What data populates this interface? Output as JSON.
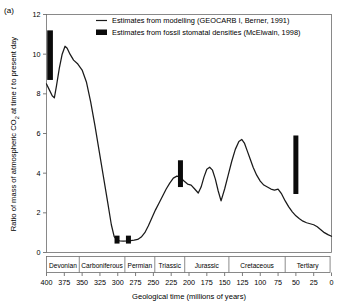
{
  "panel": {
    "label": "(a)"
  },
  "legend": {
    "position": "top-center-inside",
    "entries": [
      {
        "marker": "line",
        "label": "Estimates from modelling (GEOCARB I, Berner, 1991)"
      },
      {
        "marker": "square",
        "label": "Estimates from fossil stomatal densities (McElwain, 1998)"
      }
    ]
  },
  "chart_data": {
    "type": "line",
    "title": "",
    "xlabel": "Geological time (millions of years)",
    "ylabel": "Ratio of mass of atmospheric CO2 at time t to present day",
    "ylabel_parts": {
      "prefix": "Ratio of mass of atmospheric CO",
      "subscript": "2",
      "middle": " at time ",
      "italic": "t",
      "suffix": " to present day"
    },
    "xlim": [
      400,
      0
    ],
    "ylim": [
      0,
      12
    ],
    "x_reversed": true,
    "grid": false,
    "yticks": [
      0,
      2,
      4,
      6,
      8,
      10,
      12
    ],
    "ytick_labels": [
      "0",
      "2",
      "4",
      "6",
      "8",
      "10",
      "12"
    ],
    "xticks": [
      400,
      375,
      350,
      325,
      300,
      275,
      250,
      225,
      200,
      175,
      150,
      125,
      100,
      75,
      50,
      25,
      0
    ],
    "xtick_labels": [
      "400",
      "375",
      "350",
      "325",
      "300",
      "275",
      "250",
      "225",
      "200",
      "175",
      "150",
      "125",
      "100",
      "75",
      "50",
      "25",
      "0"
    ],
    "series": [
      {
        "name": "Estimates from modelling (GEOCARB I, Berner, 1991)",
        "type": "line",
        "color": "#1a1a1a",
        "x": [
          400,
          396,
          392,
          389,
          386,
          382,
          378,
          374,
          371,
          367,
          362,
          356,
          350,
          344,
          338,
          332,
          326,
          320,
          314,
          309,
          305,
          301,
          297,
          292,
          287,
          282,
          277,
          272,
          267,
          262,
          257,
          252,
          247,
          242,
          237,
          232,
          227,
          222,
          217,
          212,
          207,
          202,
          197,
          192,
          187,
          183,
          179,
          175,
          171,
          167,
          163,
          159,
          155,
          150,
          145,
          140,
          135,
          130,
          126,
          122,
          118,
          114,
          110,
          105,
          100,
          95,
          90,
          85,
          80,
          75,
          70,
          65,
          60,
          55,
          50,
          45,
          40,
          35,
          30,
          25,
          20,
          15,
          10,
          5,
          0
        ],
        "y": [
          8.5,
          8.2,
          7.9,
          7.8,
          8.4,
          9.3,
          10.0,
          10.4,
          10.3,
          10.0,
          9.7,
          9.5,
          9.2,
          8.6,
          7.6,
          6.4,
          5.1,
          3.8,
          2.5,
          1.4,
          0.8,
          0.62,
          0.58,
          0.57,
          0.58,
          0.6,
          0.62,
          0.66,
          0.78,
          1.0,
          1.35,
          1.75,
          2.15,
          2.5,
          2.85,
          3.2,
          3.5,
          3.75,
          3.85,
          3.8,
          3.6,
          3.45,
          3.4,
          3.2,
          3.0,
          3.3,
          3.8,
          4.2,
          4.3,
          4.15,
          3.7,
          3.1,
          2.6,
          3.2,
          3.9,
          4.6,
          5.2,
          5.6,
          5.7,
          5.5,
          5.1,
          4.7,
          4.3,
          3.9,
          3.6,
          3.4,
          3.3,
          3.2,
          3.15,
          3.2,
          2.95,
          2.6,
          2.3,
          2.05,
          1.85,
          1.7,
          1.58,
          1.5,
          1.45,
          1.4,
          1.3,
          1.15,
          1.0,
          0.9,
          0.82
        ]
      },
      {
        "name": "Estimates from fossil stomatal densities (McElwain, 1998)",
        "type": "range-bar",
        "color": "#0b0b0b",
        "bars": [
          {
            "x": 395,
            "ylow": 8.7,
            "yhigh": 11.2,
            "width_myr": 8
          },
          {
            "x": 301,
            "ylow": 0.45,
            "yhigh": 0.85,
            "width_myr": 7
          },
          {
            "x": 285,
            "ylow": 0.45,
            "yhigh": 0.85,
            "width_myr": 7
          },
          {
            "x": 212,
            "ylow": 3.3,
            "yhigh": 4.65,
            "width_myr": 7
          },
          {
            "x": 50,
            "ylow": 2.95,
            "yhigh": 5.9,
            "width_myr": 7
          }
        ]
      }
    ],
    "periods": [
      {
        "name": "Devonian",
        "start": 400,
        "end": 354
      },
      {
        "name": "Carboniferous",
        "start": 354,
        "end": 290
      },
      {
        "name": "Permian",
        "start": 290,
        "end": 248
      },
      {
        "name": "Triassic",
        "start": 248,
        "end": 206
      },
      {
        "name": "Jurassic",
        "start": 206,
        "end": 144
      },
      {
        "name": "Cretaceous",
        "start": 144,
        "end": 65
      },
      {
        "name": "Tertiary",
        "start": 65,
        "end": 2
      }
    ]
  }
}
